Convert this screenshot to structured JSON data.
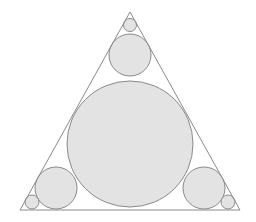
{
  "diagram": {
    "colors": {
      "background": "#ffffff",
      "stroke": "#8a8a8a",
      "circle_fill": "#e3e3e3"
    },
    "triangle": {
      "points": "130,12 20,210 240,210"
    },
    "circles": [
      {
        "name": "incircle",
        "cx": 130,
        "cy": 144,
        "r": 63
      },
      {
        "name": "top-medium",
        "cx": 130,
        "cy": 55,
        "r": 21
      },
      {
        "name": "top-small",
        "cx": 130,
        "cy": 25,
        "r": 6.5
      },
      {
        "name": "left-medium",
        "cx": 56,
        "cy": 188,
        "r": 21
      },
      {
        "name": "left-small",
        "cx": 32,
        "cy": 202,
        "r": 7
      },
      {
        "name": "right-medium",
        "cx": 204,
        "cy": 188,
        "r": 21
      },
      {
        "name": "right-small",
        "cx": 228,
        "cy": 202,
        "r": 7
      }
    ]
  }
}
